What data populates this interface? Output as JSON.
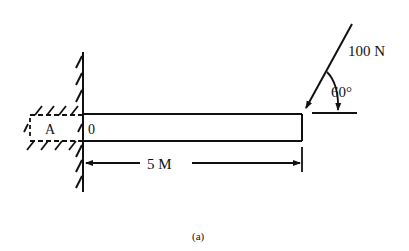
{
  "figure": {
    "caption": "(a)",
    "labels": {
      "support_point": "A",
      "origin": "0",
      "length": "5 M",
      "force": "100 N",
      "angle": "60°"
    }
  },
  "colors": {
    "ink": "#111111",
    "background": "#ffffff"
  }
}
